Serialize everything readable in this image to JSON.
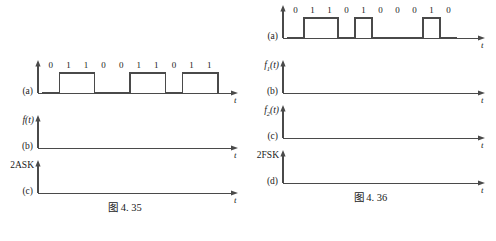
{
  "page": {
    "background_color": "#ffffff",
    "line_color": "#4a4a4a",
    "text_color": "#1a1a1a"
  },
  "figures": [
    {
      "id": "fig-left",
      "caption": "图 4. 35",
      "axes": [
        {
          "ylabel": "",
          "tag": "(a)",
          "taxis_label": "t",
          "bits": [
            "0",
            "1",
            "1",
            "0",
            "0",
            "1",
            "1",
            "0",
            "1",
            "1"
          ],
          "levels": [
            0,
            1,
            1,
            0,
            0,
            1,
            1,
            0,
            1,
            1
          ],
          "has_waveform": true
        },
        {
          "ylabel": "f(t)",
          "tag": "(b)",
          "taxis_label": "t",
          "bits": [],
          "levels": [],
          "has_waveform": false
        },
        {
          "ylabel": "2ASK",
          "ylabel_upright": true,
          "tag": "(c)",
          "taxis_label": "t",
          "bits": [],
          "levels": [],
          "has_waveform": false
        }
      ]
    },
    {
      "id": "fig-right",
      "caption": "图 4. 36",
      "axes": [
        {
          "ylabel": "",
          "tag": "(a)",
          "taxis_label": "t",
          "bits": [
            "0",
            "1",
            "1",
            "0",
            "1",
            "0",
            "0",
            "0",
            "1",
            "0"
          ],
          "levels": [
            0,
            1,
            1,
            0,
            1,
            0,
            0,
            0,
            1,
            0
          ],
          "has_waveform": true
        },
        {
          "ylabel": "f1(t)",
          "ylabel_base": "f",
          "ylabel_sub": "1",
          "ylabel_tail": "(t)",
          "tag": "(b)",
          "taxis_label": "t",
          "bits": [],
          "levels": [],
          "has_waveform": false
        },
        {
          "ylabel": "f2(t)",
          "ylabel_base": "f",
          "ylabel_sub": "2",
          "ylabel_tail": "(t)",
          "tag": "(c)",
          "taxis_label": "t",
          "bits": [],
          "levels": [],
          "has_waveform": false
        },
        {
          "ylabel": "2FSK",
          "ylabel_upright": true,
          "tag": "(d)",
          "taxis_label": "t",
          "bits": [],
          "levels": [],
          "has_waveform": false
        }
      ]
    }
  ]
}
